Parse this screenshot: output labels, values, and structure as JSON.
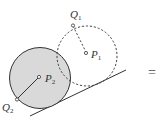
{
  "diagram": {
    "labels": {
      "q1": "Q",
      "q1_sub": "1",
      "p1": "P",
      "p1_sub": "1",
      "p2": "P",
      "p2_sub": "2",
      "q2": "Q",
      "q2_sub": "2",
      "equals": "="
    },
    "colors": {
      "filled_circle": "#d9d9d9",
      "stroke": "#333333"
    }
  }
}
